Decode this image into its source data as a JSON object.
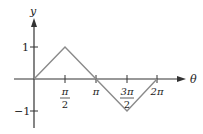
{
  "diagram": {
    "type": "function-graph",
    "axes": {
      "x_label": "θ",
      "y_label": "y",
      "axis_color": "#333333",
      "curve_color": "#8a8a8a"
    },
    "y_ticks": [
      {
        "label": "1",
        "value": 1
      },
      {
        "label": "−1",
        "value": -1
      }
    ],
    "x_ticks": [
      {
        "label_num": "π",
        "label_den": "2",
        "value": "π/2"
      },
      {
        "label": "π",
        "value": "π"
      },
      {
        "label_num": "3π",
        "label_den": "2",
        "value": "3π/2"
      },
      {
        "label": "2π",
        "value": "2π"
      }
    ],
    "curve_points": [
      {
        "x": "0",
        "y": 0
      },
      {
        "x": "π/2",
        "y": 1
      },
      {
        "x": "3π/2",
        "y": -1
      },
      {
        "x": "2π",
        "y": 0
      }
    ]
  }
}
